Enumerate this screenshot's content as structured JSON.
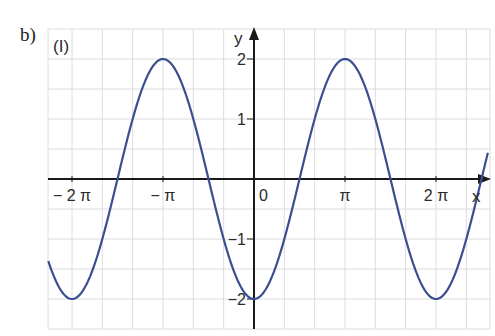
{
  "part_label": "b)",
  "chart_data": {
    "type": "line",
    "title": "(I)",
    "function": "y = -2cos(x)",
    "xlabel": "x",
    "ylabel": "y",
    "x_ticks": [
      {
        "value_pi": -2,
        "label": "− 2 π"
      },
      {
        "value_pi": -1,
        "label": "− π"
      },
      {
        "value_pi": 0,
        "label": "0"
      },
      {
        "value_pi": 1,
        "label": "π"
      },
      {
        "value_pi": 2,
        "label": "2 π"
      }
    ],
    "y_ticks": [
      {
        "value": 2,
        "label": "2"
      },
      {
        "value": 1,
        "label": "1"
      },
      {
        "value": -1,
        "label": "−1"
      },
      {
        "value": -2,
        "label": "−2"
      }
    ],
    "xlim_pi": [
      -2.26,
      2.57
    ],
    "ylim": [
      -2.5,
      2.5
    ],
    "grid": true,
    "series": [
      {
        "name": "curve",
        "color": "#3a4f8f",
        "points": [
          {
            "x_pi": -2,
            "y": -2
          },
          {
            "x_pi": -1.5,
            "y": 0
          },
          {
            "x_pi": -1,
            "y": 2
          },
          {
            "x_pi": -0.5,
            "y": 0
          },
          {
            "x_pi": 0,
            "y": -2
          },
          {
            "x_pi": 0.5,
            "y": 0
          },
          {
            "x_pi": 1,
            "y": 2
          },
          {
            "x_pi": 1.5,
            "y": 0
          },
          {
            "x_pi": 2,
            "y": -2
          },
          {
            "x_pi": 2.5,
            "y": 0
          }
        ]
      }
    ]
  },
  "colors": {
    "curve": "#3a4f8f",
    "axis": "#1a1a1a",
    "grid": "#dcdcdc"
  }
}
